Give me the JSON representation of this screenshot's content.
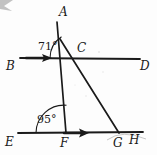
{
  "figure": {
    "width": 157,
    "height": 155,
    "background_color": "#fdfdfd",
    "stroke_color": "#1a1a1a"
  },
  "points": {
    "A": {
      "label": "A",
      "x": 63,
      "y": 18
    },
    "B": {
      "label": "B",
      "x": 9,
      "y": 66
    },
    "C": {
      "label": "C",
      "x": 80,
      "y": 50
    },
    "D": {
      "label": "D",
      "x": 143,
      "y": 66
    },
    "E": {
      "label": "E",
      "x": 8,
      "y": 143
    },
    "F": {
      "label": "F",
      "x": 62,
      "y": 145
    },
    "G": {
      "label": "G",
      "x": 117,
      "y": 144
    },
    "H": {
      "label": "H",
      "x": 133,
      "y": 142
    }
  },
  "angles": [
    {
      "id": "angle-at-c",
      "label": "71°",
      "value": 71,
      "unit": "degrees",
      "vertex": "C",
      "label_x": 40,
      "label_y": 41
    },
    {
      "id": "angle-at-f",
      "label": "95°",
      "value": 95,
      "unit": "degrees",
      "vertex": "F",
      "label_x": 38,
      "label_y": 115
    }
  ],
  "lines": [
    {
      "id": "line-bd",
      "from": "B",
      "to": "D",
      "has_parallel_arrow": true
    },
    {
      "id": "line-eh",
      "from": "E",
      "to": "H",
      "has_parallel_arrow": true
    },
    {
      "id": "line-af",
      "from": "A",
      "to": "F",
      "has_parallel_arrow": false
    },
    {
      "id": "line-cg",
      "from": "C",
      "to": "G",
      "has_parallel_arrow": false
    }
  ]
}
